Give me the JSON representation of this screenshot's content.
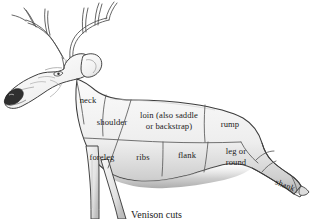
{
  "figure": {
    "caption": "Venison cuts",
    "style": {
      "outline_color": "#3a3a3a",
      "divider_color": "#555555",
      "body_fill_light": "#f2f2f2",
      "body_fill_mid": "#e0e0e0",
      "body_fill_shadow": "#b8b8b8",
      "nose_fill": "#2b2b2b",
      "background": "#ffffff",
      "text_color": "#1b1b1b"
    }
  },
  "cuts": [
    {
      "id": "neck",
      "label": "neck",
      "x": 88,
      "y": 101,
      "rotate": 0
    },
    {
      "id": "shoulder",
      "label": "shoulder",
      "x": 112,
      "y": 123,
      "rotate": 0
    },
    {
      "id": "loin",
      "label": "loin (also saddle\nor backstrap)",
      "x": 169,
      "y": 121,
      "rotate": 0
    },
    {
      "id": "rump",
      "label": "rump",
      "x": 230,
      "y": 125,
      "rotate": 0
    },
    {
      "id": "foreleg",
      "label": "foreleg",
      "x": 100,
      "y": 158,
      "rotate": 0
    },
    {
      "id": "ribs",
      "label": "ribs",
      "x": 142,
      "y": 158,
      "rotate": 0
    },
    {
      "id": "flank",
      "label": "flank",
      "x": 185,
      "y": 156,
      "rotate": 0
    },
    {
      "id": "leg-or-round",
      "label": "leg or\nround",
      "x": 234,
      "y": 156,
      "rotate": 0
    },
    {
      "id": "shank",
      "label": "shank",
      "x": 285,
      "y": 185,
      "rotate": 22
    }
  ]
}
